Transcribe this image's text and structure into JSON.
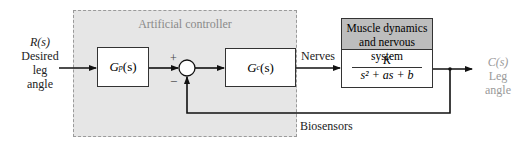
{
  "diagram": {
    "type": "block-diagram",
    "input": {
      "symbol": "R(s)",
      "label_lines": [
        "Desired",
        "leg",
        "angle"
      ]
    },
    "controller_region": {
      "title": "Artificial controller"
    },
    "blocks": [
      {
        "id": "gp",
        "label": "Gp(s)",
        "base": "G",
        "sub": "p",
        "arg": "(s)"
      },
      {
        "id": "gc",
        "label": "Gc(s)",
        "base": "G",
        "sub": "c",
        "arg": "(s)"
      }
    ],
    "summing_junction": {
      "plus": "+",
      "minus": "−"
    },
    "edge_labels": {
      "nerves": "Nerves",
      "biosensors": "Biosensors"
    },
    "plant": {
      "title_lines": [
        "Muscle dynamics",
        "and nervous system"
      ],
      "numerator": "K",
      "denominator": "s² + as + b"
    },
    "output": {
      "symbol": "C(s)",
      "label_lines": [
        "Leg",
        "angle"
      ]
    }
  }
}
